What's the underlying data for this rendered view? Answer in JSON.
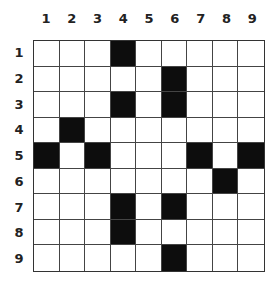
{
  "puzzle": {
    "columns": [
      "1",
      "2",
      "3",
      "4",
      "5",
      "6",
      "7",
      "8",
      "9"
    ],
    "rows": [
      "1",
      "2",
      "3",
      "4",
      "5",
      "6",
      "7",
      "8",
      "9"
    ],
    "black_cells": [
      [
        1,
        4
      ],
      [
        2,
        6
      ],
      [
        3,
        4
      ],
      [
        3,
        6
      ],
      [
        4,
        2
      ],
      [
        5,
        1
      ],
      [
        5,
        3
      ],
      [
        5,
        7
      ],
      [
        5,
        9
      ],
      [
        6,
        8
      ],
      [
        7,
        4
      ],
      [
        7,
        6
      ],
      [
        8,
        4
      ],
      [
        9,
        6
      ]
    ],
    "colors": {
      "black": "#0d0d0d",
      "white": "#ffffff",
      "grid_line": "#444444"
    }
  }
}
